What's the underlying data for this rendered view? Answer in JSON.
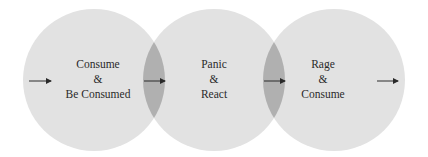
{
  "diagram": {
    "colors": {
      "circle_fill": "#e2e2e2",
      "overlap_fill": "#b0b0b0",
      "arrow": "#2a2a2a",
      "text": "#2a2a2a"
    },
    "circles": [
      {
        "id": "consume",
        "lines": [
          "Consume",
          "&",
          "Be Consumed"
        ]
      },
      {
        "id": "panic",
        "lines": [
          "Panic",
          "&",
          "React"
        ]
      },
      {
        "id": "rage",
        "lines": [
          "Rage",
          "&",
          "Consume"
        ]
      }
    ],
    "arrows": [
      "entry",
      "consume-to-panic",
      "panic-to-rage",
      "exit"
    ]
  }
}
